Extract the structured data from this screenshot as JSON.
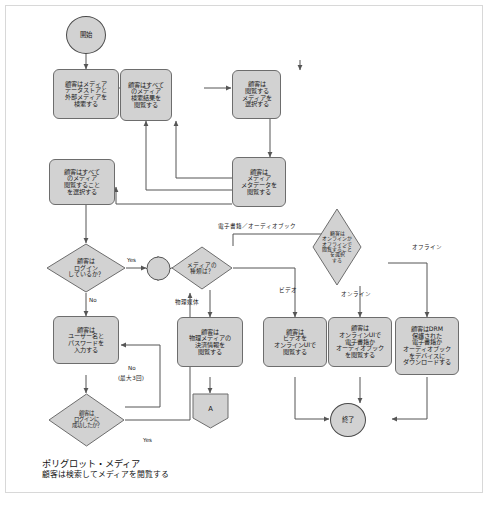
{
  "diagram": {
    "title": "ポリグロット・メディア",
    "subtitle": "顧客は検索してメディアを閲覧する",
    "fill": "#d2d2d2",
    "stroke": "#6d6d6d",
    "line": "#555555"
  },
  "nodes": {
    "start": "開始",
    "search": "顧客はメディア\nデータストアと\n外部メディアを\n検索する",
    "browse_results": "顧客はすべて\nのメディア\n検索結果を\n閲覧する",
    "select_media": "顧客は\n閲覧する\nメディアを\n選択する",
    "view_metadata": "顧客は\nメディア\nメタデータを\n閲覧する",
    "browse_all": "顧客はすべて\nのメディア\n閲覧すること\nを選択する",
    "logged_in_q": "顧客は\nログイン\nしているか？",
    "enter_creds": "顧客は\nユーザー名と\nパスワードを\n入力する",
    "login_ok_q": "顧客は\nログインに\n成功したか？",
    "media_type_q": "メディアの\n種類は？",
    "online_offline_q": "顧客は\nオンラインか\nオフラインで\n閲覧すること\nを選択\nする",
    "physical_payment": "顧客は\n物理メディアの\n決済情報を\n閲覧する",
    "video_online": "顧客は\nビデオを\nオンラインUIで\n閲覧する",
    "ebook_online": "顧客は\nオンラインUIで\n電子書籍か\nオーディオブック\nを閲覧する",
    "drm_download": "顧客はDRM\n保護された\n電子書籍か\nオーディオブック\nをデバイスに\nダウンロードする",
    "connector_a": "A",
    "end": "終了"
  },
  "edge_labels": {
    "yes_login": "Yes",
    "no_login": "No",
    "no_retry": "No",
    "no_retry_sub": "(最大3回)",
    "yes_retry": "Yes",
    "ebook_audiobook": "電子書籍／オーディオブック",
    "physical_media": "物理媒体",
    "video": "ビデオ",
    "online": "オンライン",
    "offline": "オフライン"
  }
}
